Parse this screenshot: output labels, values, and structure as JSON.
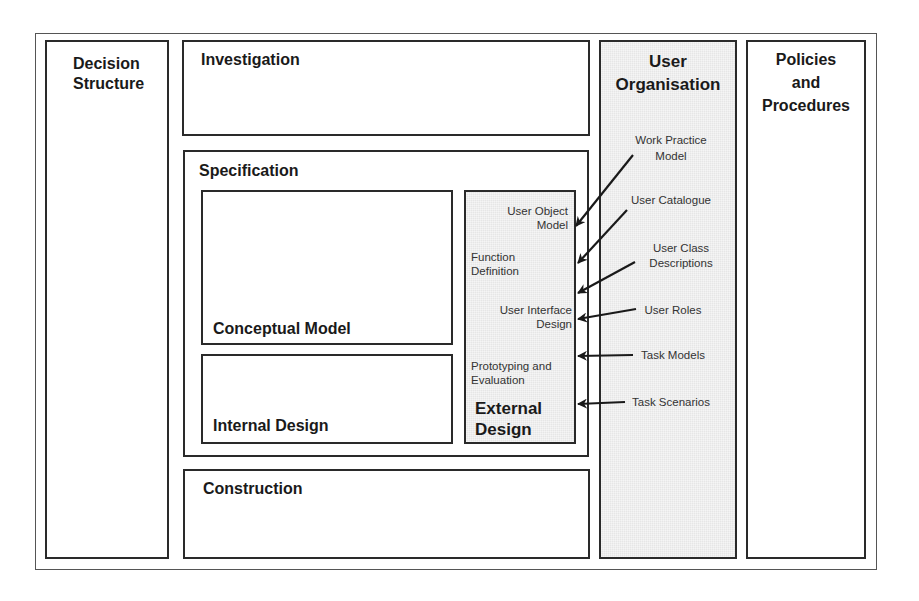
{
  "diagram": {
    "columns": {
      "decision_structure": "Decision\nStructure",
      "user_organisation": "User\nOrganisation",
      "policies_and_procedures": "Policies\nand\nProcedures"
    },
    "phases": {
      "investigation": "Investigation",
      "specification": "Specification",
      "construction": "Construction"
    },
    "specification_parts": {
      "conceptual_model": "Conceptual Model",
      "internal_design": "Internal Design",
      "external_design": "External\nDesign"
    },
    "external_design_items": [
      "User Object\nModel",
      "Function\nDefinition",
      "User Interface\nDesign",
      "Prototyping and\nEvaluation"
    ],
    "user_organisation_items": [
      "Work Practice\nModel",
      "User Catalogue",
      "User Class\nDescriptions",
      "User Roles",
      "Task Models",
      "Task Scenarios"
    ],
    "colors": {
      "line": "#2a2a2a",
      "shaded_fill": "#e6e6e6",
      "background": "#ffffff"
    }
  }
}
